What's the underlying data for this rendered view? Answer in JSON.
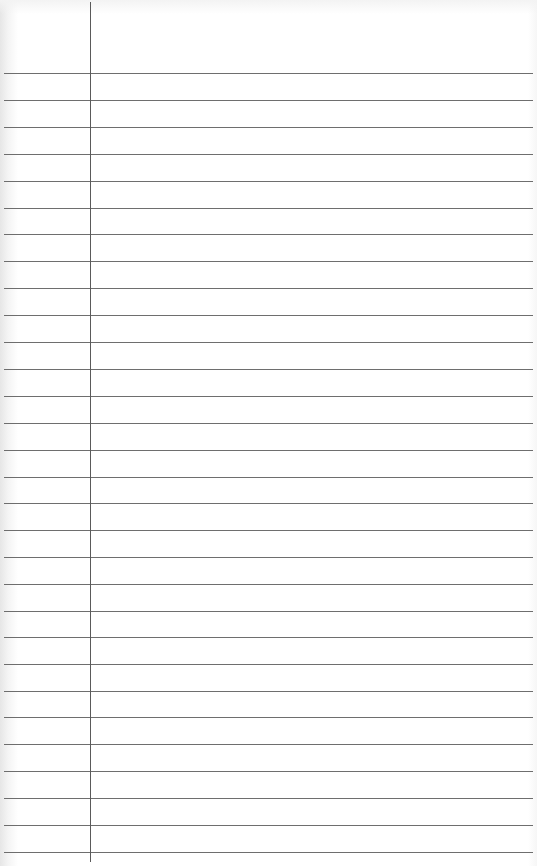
{
  "page": {
    "type": "lined-paper",
    "background_color": "#ffffff",
    "rule_color": "#6e6e6e",
    "margin_line_color": "#5a5a5a",
    "margin_line_x": 90,
    "rule_positions_y": [
      73,
      100,
      127,
      154,
      181,
      208,
      234,
      261,
      288,
      315,
      342,
      369,
      396,
      423,
      450,
      477,
      503,
      530,
      557,
      584,
      611,
      637,
      664,
      691,
      717,
      744,
      771,
      798,
      825,
      852
    ]
  }
}
